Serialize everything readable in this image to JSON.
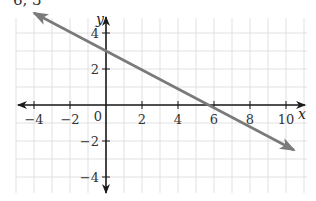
{
  "header": {
    "partial_text": "6, 3"
  },
  "colors": {
    "grid": "#d9d9d9",
    "axis": "#1a1a1a",
    "line": "#7a7a7a",
    "text": "#333333"
  },
  "chart_data": {
    "type": "line",
    "title": "",
    "xlabel": "x",
    "ylabel": "y",
    "xlim": [
      -5,
      11
    ],
    "ylim": [
      -5,
      5
    ],
    "grid": true,
    "x_ticks": [
      -4,
      -2,
      0,
      2,
      4,
      6,
      8,
      10
    ],
    "y_ticks": [
      -4,
      -2,
      2,
      4
    ],
    "origin_label": "0",
    "series": [
      {
        "name": "line",
        "equation": "y = -0.5x + 3",
        "x": [
          -4,
          0,
          6,
          11
        ],
        "y": [
          5,
          3,
          0,
          -2.5
        ],
        "arrows": "both"
      }
    ],
    "annotations": []
  }
}
